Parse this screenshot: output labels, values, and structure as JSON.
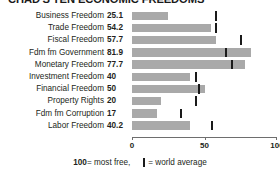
{
  "chart_data": {
    "type": "bar",
    "title": "CHAD'S TEN ECONOMIC FREEDOMS",
    "orientation": "horizontal",
    "xlabel": "",
    "ylabel": "",
    "xlim": [
      0,
      100
    ],
    "grid": false,
    "legend_position": "bottom",
    "categories": [
      "Business Freedom",
      "Trade Freedom",
      "Fiscal Freedom",
      "Fdm fm Government",
      "Monetary Freedom",
      "Investment Freedom",
      "Financial Freedom",
      "Property Rights",
      "Fdm fm Corruption",
      "Labor Freedom"
    ],
    "values": [
      25.1,
      54.2,
      57.7,
      81.9,
      77.7,
      40,
      50,
      20,
      17,
      40.2
    ],
    "value_labels": [
      "25.1",
      "54.2",
      "57.7",
      "81.9",
      "77.7",
      "40",
      "50",
      "20",
      "17",
      "40.2"
    ],
    "series": [
      {
        "name": "Chad score",
        "values": [
          25.1,
          54.2,
          57.7,
          81.9,
          77.7,
          40,
          50,
          20,
          17,
          40.2
        ]
      },
      {
        "name": "world average",
        "values": [
          58,
          58,
          75,
          65,
          69,
          44,
          46,
          44,
          34,
          55
        ]
      }
    ],
    "ticks": [
      0,
      50,
      100
    ],
    "tick_labels": [
      "0",
      "50",
      "100"
    ],
    "bar_color": "#a9a9a9",
    "marker_color": "#1a1a1a",
    "notes": [
      "100 = most free",
      "| = world average"
    ]
  },
  "legend": {
    "most_free_value": "100",
    "most_free_text": " = most free,",
    "avg_text": " = world average"
  }
}
